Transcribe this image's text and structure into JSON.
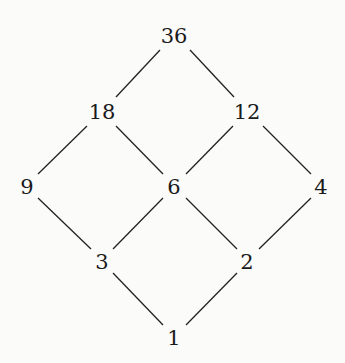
{
  "diagram": {
    "type": "hasse-diagram",
    "nodes": [
      {
        "id": "n36",
        "label": "36",
        "x": 174,
        "y": 36
      },
      {
        "id": "n18",
        "label": "18",
        "x": 102,
        "y": 112
      },
      {
        "id": "n12",
        "label": "12",
        "x": 247,
        "y": 112
      },
      {
        "id": "n9",
        "label": "9",
        "x": 27,
        "y": 187
      },
      {
        "id": "n6",
        "label": "6",
        "x": 174,
        "y": 187
      },
      {
        "id": "n4",
        "label": "4",
        "x": 321,
        "y": 187
      },
      {
        "id": "n3",
        "label": "3",
        "x": 102,
        "y": 262
      },
      {
        "id": "n2",
        "label": "2",
        "x": 247,
        "y": 262
      },
      {
        "id": "n1",
        "label": "1",
        "x": 174,
        "y": 338
      }
    ],
    "edges": [
      {
        "from": "n36",
        "to": "n18",
        "x1": 160,
        "y1": 50,
        "x2": 116,
        "y2": 97
      },
      {
        "from": "n36",
        "to": "n12",
        "x1": 190,
        "y1": 50,
        "x2": 234,
        "y2": 97
      },
      {
        "from": "n18",
        "to": "n9",
        "x1": 87,
        "y1": 126,
        "x2": 38,
        "y2": 174
      },
      {
        "from": "n18",
        "to": "n6",
        "x1": 116,
        "y1": 126,
        "x2": 163,
        "y2": 174
      },
      {
        "from": "n12",
        "to": "n6",
        "x1": 233,
        "y1": 126,
        "x2": 186,
        "y2": 174
      },
      {
        "from": "n12",
        "to": "n4",
        "x1": 263,
        "y1": 126,
        "x2": 311,
        "y2": 174
      },
      {
        "from": "n9",
        "to": "n3",
        "x1": 38,
        "y1": 198,
        "x2": 91,
        "y2": 249
      },
      {
        "from": "n6",
        "to": "n3",
        "x1": 163,
        "y1": 198,
        "x2": 113,
        "y2": 249
      },
      {
        "from": "n6",
        "to": "n2",
        "x1": 186,
        "y1": 198,
        "x2": 237,
        "y2": 249
      },
      {
        "from": "n4",
        "to": "n2",
        "x1": 311,
        "y1": 198,
        "x2": 259,
        "y2": 249
      },
      {
        "from": "n3",
        "to": "n1",
        "x1": 113,
        "y1": 273,
        "x2": 163,
        "y2": 325
      },
      {
        "from": "n2",
        "to": "n1",
        "x1": 237,
        "y1": 273,
        "x2": 186,
        "y2": 325
      }
    ],
    "line_color": "#222222",
    "text_color": "#1a1a1a"
  }
}
